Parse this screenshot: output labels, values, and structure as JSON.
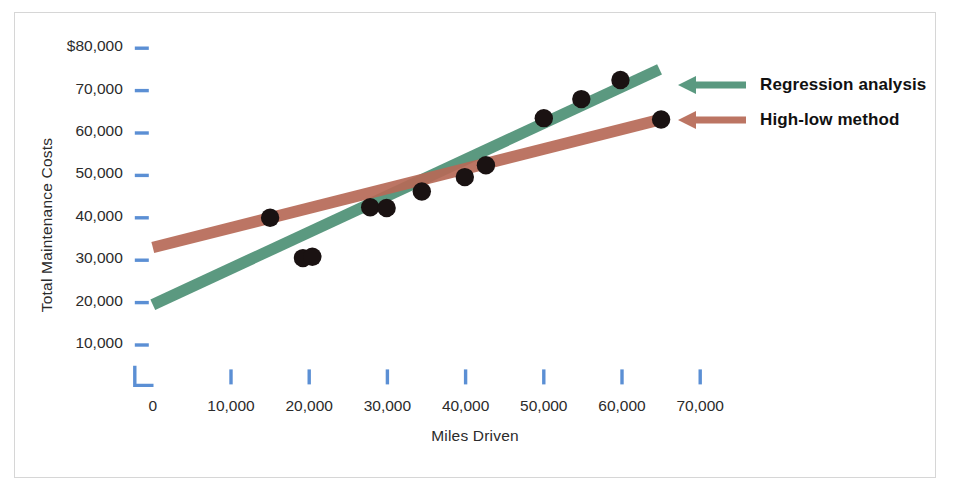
{
  "chart_data": {
    "type": "scatter",
    "title": "",
    "xlabel": "Miles Driven",
    "ylabel": "Total Maintenance Costs",
    "xlim": [
      0,
      75000
    ],
    "ylim": [
      0,
      85000
    ],
    "grid": false,
    "legend_position": "right",
    "x_ticks": [
      {
        "value": 0,
        "label": "0"
      },
      {
        "value": 10000,
        "label": "10,000"
      },
      {
        "value": 20000,
        "label": "20,000"
      },
      {
        "value": 30000,
        "label": "30,000"
      },
      {
        "value": 40000,
        "label": "40,000"
      },
      {
        "value": 50000,
        "label": "50,000"
      },
      {
        "value": 60000,
        "label": "60,000"
      },
      {
        "value": 70000,
        "label": "70,000"
      }
    ],
    "y_ticks": [
      {
        "value": 10000,
        "label": "10,000"
      },
      {
        "value": 20000,
        "label": "20,000"
      },
      {
        "value": 30000,
        "label": "30,000"
      },
      {
        "value": 40000,
        "label": "40,000"
      },
      {
        "value": 50000,
        "label": "50,000"
      },
      {
        "value": 60000,
        "label": "60,000"
      },
      {
        "value": 70000,
        "label": "70,000"
      },
      {
        "value": 80000,
        "label": "$80,000"
      }
    ],
    "points": [
      {
        "x": 15000,
        "y": 40000
      },
      {
        "x": 19200,
        "y": 30500
      },
      {
        "x": 20400,
        "y": 30800
      },
      {
        "x": 27800,
        "y": 42500
      },
      {
        "x": 29900,
        "y": 42300
      },
      {
        "x": 34400,
        "y": 46200
      },
      {
        "x": 39900,
        "y": 49600
      },
      {
        "x": 42600,
        "y": 52400
      },
      {
        "x": 50000,
        "y": 63500
      },
      {
        "x": 54800,
        "y": 68000
      },
      {
        "x": 59800,
        "y": 72500
      },
      {
        "x": 65000,
        "y": 63200
      }
    ],
    "series": [
      {
        "name": "Regression analysis",
        "type": "line",
        "color": "#4e9176",
        "x_start": 0,
        "y_start": 19500,
        "x_end": 64800,
        "y_end": 75000
      },
      {
        "name": "High-low method",
        "type": "line",
        "color": "#b76a57",
        "x_start": 0,
        "y_start": 33000,
        "x_end": 65000,
        "y_end": 63200
      }
    ],
    "point_color": "#1a1212",
    "axis_color": "#5b8fd4"
  },
  "legend": {
    "items": [
      {
        "label": "Regression analysis",
        "color": "#4e9176",
        "icon": "left-arrow-icon"
      },
      {
        "label": "High-low method",
        "color": "#b76a57",
        "icon": "left-arrow-icon"
      }
    ]
  }
}
